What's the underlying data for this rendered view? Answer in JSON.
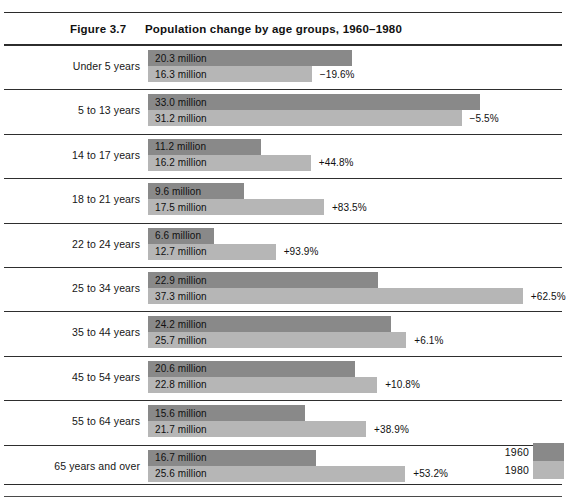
{
  "header": {
    "figure_number": "Figure 3.7",
    "title": "Population change by age groups, 1960–1980"
  },
  "legend": {
    "series": [
      {
        "label": "1960",
        "color": "#898989"
      },
      {
        "label": "1980",
        "color": "#b6b6b6"
      }
    ]
  },
  "chart_data": {
    "type": "bar",
    "title": "Population change by age groups, 1960–1980",
    "xlabel": "",
    "ylabel": "",
    "orientation": "horizontal",
    "unit": "million",
    "grid": false,
    "legend_position": "bottom-right",
    "axis_range": [
      0,
      37.3
    ],
    "categories": [
      "Under 5 years",
      "5 to 13 years",
      "14 to 17 years",
      "18 to 21 years",
      "22 to 24 years",
      "25 to 34 years",
      "35 to 44 years",
      "45 to 54 years",
      "55 to 64 years",
      "65 years and over"
    ],
    "series": [
      {
        "name": "1960",
        "color": "#898989",
        "values": [
          20.3,
          33.0,
          11.2,
          9.6,
          6.6,
          22.9,
          24.2,
          20.6,
          15.6,
          16.7
        ],
        "value_labels": [
          "20.3 million",
          "33.0 million",
          "11.2 million",
          "9.6 million",
          "6.6 million",
          "22.9 million",
          "24.2 million",
          "20.6 million",
          "15.6 million",
          "16.7 million"
        ]
      },
      {
        "name": "1980",
        "color": "#b6b6b6",
        "values": [
          16.3,
          31.2,
          16.2,
          17.5,
          12.7,
          37.3,
          25.7,
          22.8,
          21.7,
          25.6
        ],
        "value_labels": [
          "16.3 million",
          "31.2 million",
          "16.2 million",
          "17.5 million",
          "12.7 million",
          "37.3 million",
          "25.7 million",
          "22.8 million",
          "21.7 million",
          "25.6 million"
        ]
      }
    ],
    "percent_change": [
      -19.6,
      -5.5,
      44.8,
      83.5,
      93.9,
      62.5,
      6.1,
      10.8,
      38.9,
      53.2
    ],
    "percent_change_labels": [
      "−19.6%",
      "−5.5%",
      "+44.8%",
      "+83.5%",
      "+93.9%",
      "+62.5%",
      "+6.1%",
      "+10.8%",
      "+38.9%",
      "+53.2%"
    ]
  }
}
